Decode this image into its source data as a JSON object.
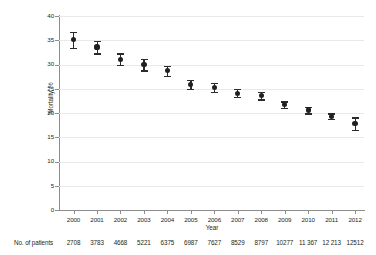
{
  "chart_data": {
    "type": "scatter",
    "title": "",
    "xlabel": "Year",
    "ylabel": "Mortality, %",
    "x": [
      2000,
      2001,
      2002,
      2003,
      2004,
      2005,
      2006,
      2007,
      2008,
      2009,
      2010,
      2011,
      2012
    ],
    "categories": [
      "2000",
      "2001",
      "2002",
      "2003",
      "2004",
      "2005",
      "2006",
      "2007",
      "2008",
      "2009",
      "2010",
      "2011",
      "2012"
    ],
    "values": [
      35.1,
      33.6,
      31.1,
      30.0,
      28.7,
      25.9,
      25.3,
      24.1,
      23.6,
      21.7,
      20.6,
      19.3,
      17.8
    ],
    "error_low": [
      33.4,
      32.3,
      29.9,
      28.8,
      27.7,
      25.0,
      24.4,
      23.3,
      22.8,
      21.0,
      19.9,
      18.7,
      16.5
    ],
    "error_high": [
      36.8,
      34.9,
      32.3,
      31.2,
      29.7,
      26.8,
      26.2,
      24.9,
      24.4,
      22.4,
      21.3,
      19.9,
      19.1
    ],
    "ylim": [
      0,
      40
    ],
    "ytick_values": [
      0,
      5,
      10,
      15,
      20,
      25,
      30,
      35,
      40
    ],
    "ytick_labels": [
      "0",
      "5",
      "10",
      "15",
      "20",
      "25",
      "30",
      "35",
      "40"
    ],
    "xtick_labels": [
      "2000",
      "2001",
      "2002",
      "2003",
      "2004",
      "2005",
      "2006",
      "2007",
      "2008",
      "2009",
      "2010",
      "2011",
      "2012"
    ],
    "grid": true,
    "grid_axis": "y",
    "legend": false,
    "marker_color": "#231f20",
    "errorbar_color": "#2b2b2b",
    "gridline_color": "#e9e9e9",
    "axis_color": "#8d8d8d",
    "error_note": "error bars show 95% CI"
  },
  "footer": {
    "label": "No. of patients",
    "values": [
      "2708",
      "3783",
      "4668",
      "5221",
      "6375",
      "6987",
      "7627",
      "8529",
      "8797",
      "10277",
      "11 367",
      "12 213",
      "12512"
    ]
  }
}
